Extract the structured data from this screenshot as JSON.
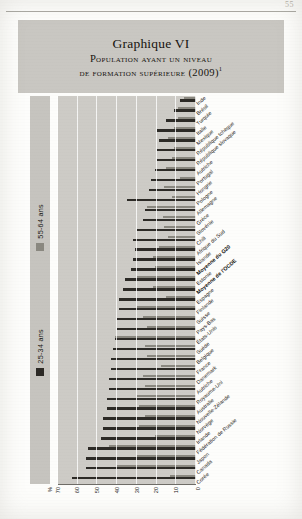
{
  "page": {
    "folio": "55"
  },
  "figure": {
    "number": "Graphique VI",
    "title_line1": "Population ayant un niveau",
    "title_line2": "de formation supérieure (2009)",
    "title_footnote": "1"
  },
  "legend": {
    "items": [
      {
        "label": "55-64 ans",
        "color": "#8a8880",
        "series_key": "old"
      },
      {
        "label": "25-34 ans",
        "color": "#2c2a26",
        "series_key": "young"
      }
    ]
  },
  "axis": {
    "unit_label": "%",
    "ticks": [
      "70",
      "60",
      "50",
      "40",
      "30",
      "20",
      "10",
      "0"
    ],
    "direction": "right-to-left"
  },
  "chart_data": {
    "type": "bar",
    "orientation": "horizontal",
    "title": "Population ayant un niveau de formation supérieure (2009)",
    "xlabel": "%",
    "ylabel": "",
    "xlim": [
      0,
      70
    ],
    "grid": true,
    "legend_position": "left-vertical",
    "categories": [
      "Inde",
      "Brésil",
      "Turquie",
      "Italie",
      "Mexique",
      "République tchèque",
      "République slovaque",
      "Autriche",
      "Portugal",
      "Hongrie",
      "Pologne",
      "Allemagne",
      "Grèce",
      "Slovénie",
      "Chili",
      "Afrique du Sud",
      "Islande",
      "Moyenne du G20",
      "Estonie",
      "Moyenne de l'OCDE",
      "Espagne",
      "Finlande",
      "Suisse",
      "Pays-Bas",
      "États-Unis",
      "Suède",
      "Belgique",
      "France",
      "Danemark",
      "Autriche",
      "Royaume-Uni",
      "Australie",
      "Nouvelle-Zélande",
      "Norvège",
      "Irlande",
      "Fédération de Russie",
      "Japon",
      "Canada",
      "Corée"
    ],
    "series": [
      {
        "name": "55-64 ans",
        "color": "#8a8880",
        "values": [
          6,
          9,
          9,
          11,
          14,
          11,
          12,
          15,
          8,
          16,
          12,
          25,
          17,
          16,
          14,
          19,
          22,
          21,
          30,
          22,
          15,
          30,
          27,
          25,
          41,
          26,
          25,
          18,
          27,
          26,
          30,
          29,
          26,
          29,
          21,
          44,
          30,
          40,
          13
        ]
      },
      {
        "name": "25-34 ans",
        "color": "#2c2a26",
        "values": [
          8,
          11,
          15,
          20,
          19,
          20,
          20,
          21,
          23,
          24,
          35,
          26,
          27,
          30,
          32,
          31,
          32,
          33,
          36,
          37,
          39,
          39,
          40,
          40,
          41,
          42,
          43,
          43,
          44,
          44,
          45,
          45,
          47,
          47,
          48,
          55,
          56,
          56,
          63
        ]
      }
    ]
  }
}
